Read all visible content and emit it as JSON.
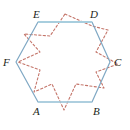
{
  "figure": {
    "canvas": {
      "width": 130,
      "height": 130,
      "background": "#ffffff"
    },
    "colors": {
      "hexagon_stroke": "#7fa8c4",
      "hexagon_top_edge": "#a8cede",
      "hexagon_fill": "none",
      "dashed_stroke": "#c4756a",
      "label_color": "#231f20"
    },
    "hexagon": {
      "name": "hexagon-ABCDEF",
      "stroke_width": 1.2,
      "closed": true,
      "vertices": [
        {
          "id": "A",
          "label": "A",
          "x": 38,
          "y": 102,
          "label_x": 33,
          "label_y": 106
        },
        {
          "id": "B",
          "label": "B",
          "x": 92,
          "y": 102,
          "label_x": 93,
          "label_y": 106
        },
        {
          "id": "C",
          "label": "C",
          "x": 110,
          "y": 62,
          "label_x": 114,
          "label_y": 58
        },
        {
          "id": "D",
          "label": "D",
          "x": 92,
          "y": 22,
          "label_x": 90,
          "label_y": 10
        },
        {
          "id": "E",
          "label": "E",
          "x": 38,
          "y": 22,
          "label_x": 33,
          "label_y": 10
        },
        {
          "id": "F",
          "label": "F",
          "x": 16,
          "y": 62,
          "label_x": 3,
          "label_y": 58
        }
      ],
      "points_attr": "38,102 92,102 110,62 92,22 38,22 16,62"
    },
    "dashed_overlay": {
      "name": "dashed-outline",
      "stroke_width": 1.1,
      "dash_pattern": "2.2 2.2",
      "closed": true,
      "description": "Dashed six-pointed outline overlapping the hexagon",
      "points_attr": "65,14 92,26 108,30 96,52 118,64 96,72 104,88 76,84 64,110 52,84 34,92 40,70 18,62 40,52 24,34 50,36"
    },
    "labels_note": "Vertex letters A B C D E F in italic serif"
  }
}
